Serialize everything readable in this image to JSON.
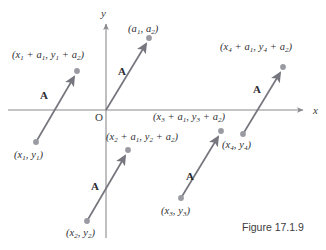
{
  "figure": {
    "caption": "Figure 17.1.9",
    "background_color": "#ffffff",
    "axis_color": "#8a8a8e",
    "vector_color": "#76767e",
    "dot_color": "#9a9aa2",
    "text_color": "#2f2f33"
  },
  "axes": {
    "x_label": "x",
    "y_label": "y",
    "origin_label": "O",
    "x_axis": {
      "x1": 8,
      "y1": 110,
      "x2": 305,
      "y2": 110
    },
    "y_axis": {
      "x1": 106,
      "y1": 238,
      "x2": 106,
      "y2": 22
    }
  },
  "vector_name": "A",
  "vectors": [
    {
      "name": "vector-1",
      "label": "A",
      "label_x": 40,
      "label_y": 91,
      "tail": {
        "x": 36,
        "y": 142
      },
      "head": {
        "x": 77,
        "y": 72
      },
      "tail_point_label": "(x₁, y₁)",
      "head_point_label": "(x₁ + a₁, y₁ + a₂)"
    },
    {
      "name": "vector-origin",
      "label": "A",
      "label_x": 118,
      "label_y": 68,
      "tail": {
        "x": 106,
        "y": 110
      },
      "head": {
        "x": 149,
        "y": 39
      },
      "tail_point_label": "",
      "head_point_label": "(a₁, a₂)"
    },
    {
      "name": "vector-2",
      "label": "A",
      "label_x": 91,
      "label_y": 182,
      "tail": {
        "x": 87,
        "y": 221
      },
      "head": {
        "x": 128,
        "y": 151
      },
      "tail_point_label": "(x₂, y₂)",
      "head_point_label": "(x₂ + a₁, y₂ + a₂)"
    },
    {
      "name": "vector-3",
      "label": "A",
      "label_x": 186,
      "label_y": 172,
      "tail": {
        "x": 181,
        "y": 198
      },
      "head": {
        "x": 221,
        "y": 132
      },
      "tail_point_label": "(x₃, y₃)",
      "head_point_label": "(x₃ + a₁, y₃ + a₂)"
    },
    {
      "name": "vector-4",
      "label": "A",
      "label_x": 253,
      "label_y": 85,
      "tail": {
        "x": 243,
        "y": 134
      },
      "head": {
        "x": 283,
        "y": 68
      },
      "tail_point_label": "(x₄, y₄)",
      "head_point_label": "(x₄ + a₁, y₄ + a₂)"
    }
  ],
  "labels": {
    "p1_head": {
      "text_parts": [
        "(x",
        "1",
        " + a",
        "1",
        ", y",
        "1",
        " + a",
        "2",
        ")"
      ],
      "x": 12,
      "y": 52
    },
    "p1_tail": {
      "text_parts": [
        "(x",
        "1",
        ", y",
        "1",
        ")"
      ],
      "x": 14,
      "y": 152
    },
    "a_head": {
      "text_parts": [
        "(a",
        "1",
        ", a",
        "2",
        ")"
      ],
      "x": 128,
      "y": 26
    },
    "p2_head": {
      "text_parts": [
        "(x",
        "2",
        " + a",
        "1",
        ", y",
        "2",
        " + a",
        "2",
        ")"
      ],
      "x": 106,
      "y": 134
    },
    "p2_tail": {
      "text_parts": [
        "(x",
        "2",
        ", y",
        "2",
        ")"
      ],
      "x": 66,
      "y": 230
    },
    "p3_head": {
      "text_parts": [
        "(x",
        "3",
        " + a",
        "1",
        ", y",
        "3",
        " + a",
        "2",
        ")"
      ],
      "x": 153,
      "y": 114
    },
    "p3_tail": {
      "text_parts": [
        "(x",
        "3",
        ", y",
        "3",
        ")"
      ],
      "x": 161,
      "y": 208
    },
    "p4_head": {
      "text_parts": [
        "(x",
        "4",
        " + a",
        "1",
        ", y",
        "4",
        " + a",
        "2",
        ")"
      ],
      "x": 220,
      "y": 44
    },
    "p4_tail": {
      "text_parts": [
        "(x",
        "4",
        ", y",
        "4",
        ")"
      ],
      "x": 222,
      "y": 142
    },
    "x_axis": {
      "x": 313,
      "y": 107
    },
    "y_axis": {
      "x": 101,
      "y": 10
    },
    "origin": {
      "x": 96,
      "y": 113
    },
    "caption": {
      "x": 242,
      "y": 225
    }
  }
}
